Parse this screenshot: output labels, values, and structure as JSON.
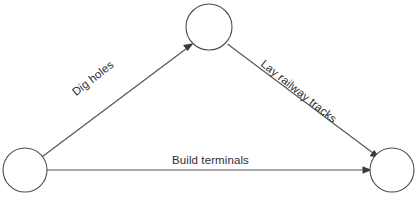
{
  "diagram": {
    "background_color": "#ffffff",
    "stroke_color": "#555555",
    "node_stroke_color": "#4a4a4a",
    "text_color": "#2e2e2e",
    "nodes": [
      {
        "id": "start",
        "label": "",
        "cx": 25,
        "cy": 170,
        "r": 22
      },
      {
        "id": "top",
        "label": "",
        "cx": 209,
        "cy": 27,
        "r": 23
      },
      {
        "id": "end",
        "label": "",
        "cx": 392,
        "cy": 170,
        "r": 22
      }
    ],
    "edges": [
      {
        "id": "dig-holes",
        "label": "Dig holes",
        "from": "start",
        "to": "top",
        "rotation_deg": -38,
        "directed": true
      },
      {
        "id": "lay-railway-tracks",
        "label": "Lay railway tracks",
        "from": "top",
        "to": "end",
        "rotation_deg": 38.5,
        "directed": true
      },
      {
        "id": "build-terminals",
        "label": "Build terminals",
        "from": "start",
        "to": "end",
        "rotation_deg": 0,
        "directed": true
      }
    ]
  }
}
